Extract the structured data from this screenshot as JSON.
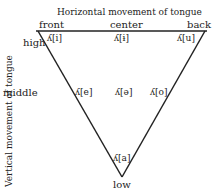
{
  "diagram": {
    "title_horizontal": "Horizontal movement of tongue",
    "title_vertical": "Vertical movement of tongue",
    "horizontal_labels": {
      "front": "front",
      "center": "center",
      "back": "back"
    },
    "vertical_labels": {
      "high": "high",
      "middle": "middle",
      "low": "low"
    },
    "vowels": [
      {
        "glyph": "ʎ",
        "ipa": "[i]",
        "label": "ʎ[i]",
        "position": "high-front"
      },
      {
        "glyph": "ʎ",
        "ipa": "[ɨ]",
        "label": "ʎ[ɨ]",
        "position": "high-center"
      },
      {
        "glyph": "ʎ",
        "ipa": "[u]",
        "label": "ʎ[u]",
        "position": "high-back"
      },
      {
        "glyph": "ʎ",
        "ipa": "[e]",
        "label": "ʎ[e]",
        "position": "middle-front"
      },
      {
        "glyph": "ʎ",
        "ipa": "[ə]",
        "label": "ʎ[ə]",
        "position": "middle-center"
      },
      {
        "glyph": "ʎ",
        "ipa": "[o]",
        "label": "ʎ[o]",
        "position": "middle-back"
      },
      {
        "glyph": "ʎ",
        "ipa": "[a]",
        "label": "ʎ[a]",
        "position": "low-center"
      }
    ],
    "line_color": "#222222"
  }
}
